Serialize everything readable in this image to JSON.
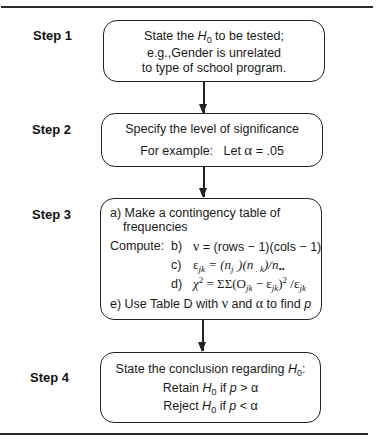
{
  "diagram": {
    "type": "flowchart",
    "steps": [
      {
        "label": "Step 1",
        "lines": [
          {
            "pre": "State the ",
            "var": "H",
            "sub": "0",
            "post": " to be tested;"
          },
          {
            "text": "e.g.,Gender is unrelated"
          },
          {
            "text": "to type of school program."
          }
        ]
      },
      {
        "label": "Step 2",
        "lines": [
          {
            "text": "Specify the level of significance"
          },
          {
            "pre": "For example:   Let ",
            "sym": "α",
            "post": " = .05"
          }
        ]
      },
      {
        "label": "Step 3",
        "lines": [
          {
            "text": "a) Make a contingency table of"
          },
          {
            "text": "frequencies"
          },
          {
            "lead": "Compute:",
            "tag": "b)",
            "pre": "ν",
            "post": " = (rows − 1)(cols − 1)"
          },
          {
            "tag": "c)",
            "formula_c": {
              "eps": "ε",
              "sub1": "jk",
              "rest": " = (n",
              "sub2": "j .",
              "mid": ")(n",
              "sub3": " . k",
              "end": ")/n",
              "sub4": "••"
            }
          },
          {
            "tag": "d)",
            "formula_d": {
              "chi": "χ",
              "sup": "2",
              "eq": " = ΣΣ(O",
              "sub1": "jk",
              "minus": " − ε",
              "sub2": "jk",
              "close": ")",
              "sup2": "2",
              "div": " /ε",
              "sub3": "jk"
            }
          },
          {
            "pre": "e) Use Table D with ",
            "sym1": "ν",
            "mid": " and ",
            "sym2": "α",
            "post": " to find ",
            "var": "p"
          }
        ]
      },
      {
        "label": "Step 4",
        "lines": [
          {
            "pre": "State the conclusion regarding ",
            "var": "H",
            "sub": "0",
            "post": ":"
          },
          {
            "pre": "Retain ",
            "var": "H",
            "sub": "0",
            "mid": " if ",
            "var2": "p",
            "post": " > α"
          },
          {
            "pre": "Reject ",
            "var": "H",
            "sub": "0",
            "mid": " if ",
            "var2": "p",
            "post": " < α"
          }
        ]
      }
    ]
  }
}
